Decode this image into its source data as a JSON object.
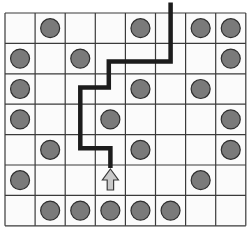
{
  "diagram": {
    "grid": {
      "columns": 8,
      "rows": 7
    },
    "colors": {
      "background": "#ffffff",
      "cell_fill": "#fbfbfb",
      "grid_line": "#3a3a3a",
      "circle_fill": "#7a7a7a",
      "circle_stroke": "#2e2e2e",
      "path": "#1c1c1c",
      "arrow_fill": "#c8c8c8",
      "arrow_stroke": "#3a3a3a"
    },
    "circles": [
      {
        "row": 0,
        "col": 1
      },
      {
        "row": 0,
        "col": 4
      },
      {
        "row": 0,
        "col": 6
      },
      {
        "row": 0,
        "col": 7
      },
      {
        "row": 1,
        "col": 0
      },
      {
        "row": 1,
        "col": 2
      },
      {
        "row": 1,
        "col": 7
      },
      {
        "row": 2,
        "col": 0
      },
      {
        "row": 2,
        "col": 4
      },
      {
        "row": 2,
        "col": 6
      },
      {
        "row": 3,
        "col": 0
      },
      {
        "row": 3,
        "col": 3
      },
      {
        "row": 3,
        "col": 7
      },
      {
        "row": 4,
        "col": 1
      },
      {
        "row": 4,
        "col": 4
      },
      {
        "row": 4,
        "col": 7
      },
      {
        "row": 5,
        "col": 0
      },
      {
        "row": 5,
        "col": 6
      },
      {
        "row": 6,
        "col": 1
      },
      {
        "row": 6,
        "col": 2
      },
      {
        "row": 6,
        "col": 3
      },
      {
        "row": 6,
        "col": 4
      },
      {
        "row": 6,
        "col": 5
      }
    ],
    "arrow": {
      "row": 5,
      "col": 3,
      "direction": "up",
      "icon": "up-arrow-icon"
    },
    "path": {
      "description": "Path enters from top above column 5 and winds down to the arrow",
      "waypoints": [
        {
          "col": 5.5,
          "row": -0.35
        },
        {
          "col": 5.5,
          "row": 1.6
        },
        {
          "col": 3.45,
          "row": 1.6
        },
        {
          "col": 3.45,
          "row": 2.45
        },
        {
          "col": 2.5,
          "row": 2.45
        },
        {
          "col": 2.5,
          "row": 4.45
        },
        {
          "col": 3.5,
          "row": 4.45
        },
        {
          "col": 3.5,
          "row": 5.1
        }
      ]
    }
  }
}
